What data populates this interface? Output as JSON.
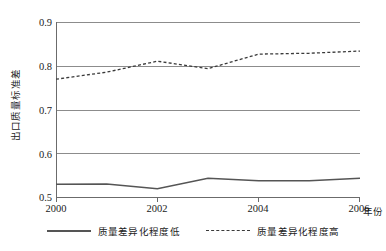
{
  "chart_data": {
    "type": "line",
    "title": "",
    "xlabel": "年份",
    "ylabel": "出口质量标准差",
    "x": [
      2000,
      2001,
      2002,
      2003,
      2004,
      2005,
      2006
    ],
    "xlim": [
      2000,
      2006
    ],
    "ylim": [
      0.5,
      0.9
    ],
    "xticks": [
      2000,
      2002,
      2004,
      2006
    ],
    "xtick_labels": [
      "2000",
      "2002",
      "2004",
      "2006"
    ],
    "yticks": [
      0.5,
      0.6,
      0.7,
      0.8,
      0.9
    ],
    "ytick_labels": [
      "0.5",
      "0.6",
      "0.7",
      "0.8",
      "0.9"
    ],
    "grid": true,
    "grid_axis": "y",
    "legend_position": "bottom",
    "series": [
      {
        "name": "质量差异化程度低",
        "style": "solid",
        "color": "#555555",
        "values": [
          0.531,
          0.532,
          0.521,
          0.545,
          0.539,
          0.539,
          0.545
        ]
      },
      {
        "name": "质量差异化程度高",
        "style": "dashed",
        "color": "#3a3a3a",
        "values": [
          0.77,
          0.786,
          0.811,
          0.794,
          0.827,
          0.829,
          0.834
        ]
      }
    ]
  },
  "axes": {
    "y_title": "出口质量标准差",
    "x_title": "年份",
    "y_ticks": [
      "0.9",
      "0.8",
      "0.7",
      "0.6",
      "0.5"
    ],
    "x_ticks": [
      "2000",
      "2002",
      "2004",
      "2006"
    ]
  },
  "legend": {
    "items": [
      {
        "label": "质量差异化程度低",
        "style": "solid"
      },
      {
        "label": "质量差异化程度高",
        "style": "dashed"
      }
    ]
  }
}
